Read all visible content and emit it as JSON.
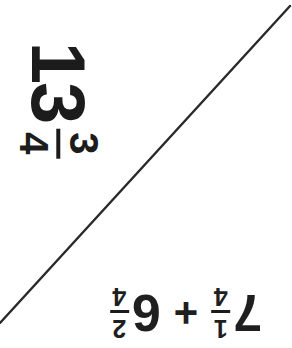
{
  "canvas": {
    "width": 292,
    "height": 348,
    "background_color": "#ffffff",
    "ink_color": "#1c1c1c"
  },
  "answer": {
    "whole": "13",
    "numerator": "3",
    "denominator": "4",
    "reading": "13 3/4",
    "rotation_degrees": 90
  },
  "problem": {
    "first_whole": "7",
    "first_numerator": "1",
    "first_denominator": "4",
    "operator": "+",
    "second_whole": "6",
    "second_numerator": "2",
    "second_denominator": "4",
    "reading": "7 1/4 + 6 2/4",
    "rotation_degrees": 180
  },
  "diagonal_line": {
    "x1": 0,
    "y1": 323,
    "x2": 290,
    "y2": 6,
    "stroke_color": "#2a2a2a",
    "stroke_width": 2.4
  }
}
